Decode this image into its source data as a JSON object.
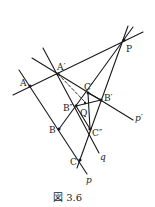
{
  "figure": {
    "caption": "図 3.6",
    "stroke_color": "#1a1a1a",
    "background": "#ffffff"
  },
  "points": {
    "P": {
      "label": "P",
      "x": 124,
      "y": 40
    },
    "A": {
      "label": "A",
      "x": 30,
      "y": 86
    },
    "A1": {
      "label": "A′",
      "x": 58,
      "y": 74
    },
    "B": {
      "label": "B",
      "x": 59,
      "y": 129
    },
    "C": {
      "label": "C",
      "x": 80,
      "y": 160
    },
    "B1": {
      "label": "B′",
      "x": 101,
      "y": 100
    },
    "C1": {
      "label": "C′",
      "x": 88,
      "y": 93
    },
    "B2": {
      "label": "B″",
      "x": 76,
      "y": 106
    },
    "C2": {
      "label": "C″",
      "x": 90,
      "y": 129
    },
    "Q": {
      "label": "Q",
      "x": 85,
      "y": 104
    }
  },
  "line_labels": {
    "p": "p",
    "p1": "p′",
    "q": "q"
  }
}
